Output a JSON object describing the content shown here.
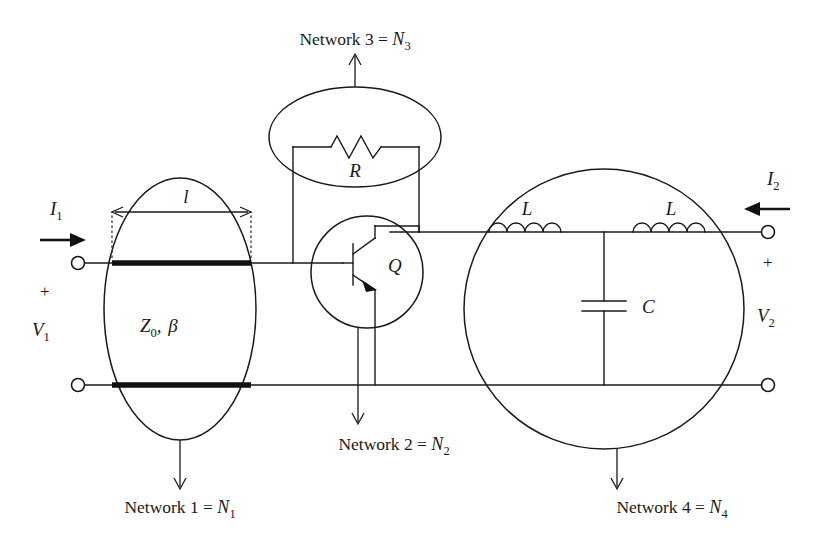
{
  "figure": {
    "kind": "circuit-partition-diagram",
    "background_color": "#ffffff",
    "line_color": "#1a1a1a",
    "width": 819,
    "height": 560
  },
  "networks": [
    {
      "id": "n1",
      "label": "Network 1 = ",
      "symbol": "N",
      "subscript": "1",
      "shape": "ellipse",
      "contents": "transmission line"
    },
    {
      "id": "n2",
      "label": "Network 2 = ",
      "symbol": "N",
      "subscript": "2",
      "shape": "circle",
      "contents": "transistor Q"
    },
    {
      "id": "n3",
      "label": "Network 3 = ",
      "symbol": "N",
      "subscript": "3",
      "shape": "ellipse",
      "contents": "resistor R"
    },
    {
      "id": "n4",
      "label": "Network 4 = ",
      "symbol": "N",
      "subscript": "4",
      "shape": "circle",
      "contents": "L-C-L pi network"
    }
  ],
  "components": {
    "transmission_line": {
      "impedance_label": "Z",
      "impedance_sub": "0",
      "impedance_sep": ", ",
      "beta_label": "β",
      "length_label": "l"
    },
    "resistor": {
      "label": "R"
    },
    "transistor": {
      "label": "Q",
      "type": "npn-bipolar"
    },
    "inductor_left": {
      "label": "L"
    },
    "inductor_right": {
      "label": "L"
    },
    "capacitor": {
      "label": "C"
    }
  },
  "ports": {
    "input": {
      "current_label": "I",
      "current_sub": "1",
      "polarity": "+",
      "voltage_label": "V",
      "voltage_sub": "1",
      "current_direction": "right"
    },
    "output": {
      "current_label": "I",
      "current_sub": "2",
      "polarity": "+",
      "voltage_label": "V",
      "voltage_sub": "2",
      "current_direction": "left"
    }
  }
}
